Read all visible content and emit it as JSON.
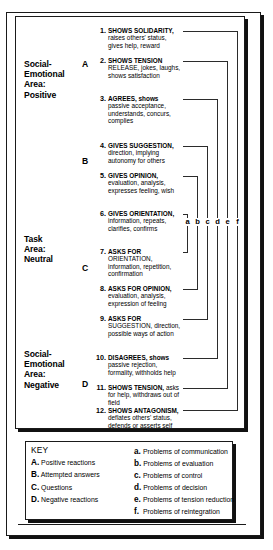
{
  "diagram": {
    "areas": [
      {
        "id": "positive",
        "label": "Social-\nEmotional\nArea:\nPositive",
        "letter": "A"
      },
      {
        "id": "neutral_b",
        "label": "",
        "letter": "B"
      },
      {
        "id": "neutral",
        "label": "Task\nArea:\nNeutral",
        "letter": "C"
      },
      {
        "id": "negative",
        "label": "Social-\nEmotional\nArea:\nNegative",
        "letter": "D"
      }
    ],
    "area_labels": [
      {
        "id": "area-label-positive",
        "lines": [
          "Social-",
          "Emotional",
          "Area:",
          "Positive"
        ]
      },
      {
        "id": "area-label-neutral",
        "lines": [
          "Task",
          "Area:",
          "Neutral"
        ]
      },
      {
        "id": "area-label-negative",
        "lines": [
          "Social-",
          "Emotional",
          "Area:",
          "Negative"
        ]
      }
    ],
    "group_letters": [
      "A",
      "B",
      "C",
      "D"
    ],
    "acts": [
      {
        "num": "1.",
        "head": "SHOWS SOLIDARITY,",
        "body": "raises others' status, gives help, reward"
      },
      {
        "num": "2.",
        "head": "SHOWS TENSION",
        "body": "RELEASE, jokes, laughs, shows satisfaction"
      },
      {
        "num": "3.",
        "head": "AGREES, shows",
        "body": "passive acceptance, understands, concurs, complies"
      },
      {
        "num": "4.",
        "head": "GIVES SUGGESTION,",
        "body": "direction, implying autonomy for others"
      },
      {
        "num": "5.",
        "head": "GIVES OPINION,",
        "body": "evaluation, analysis, expresses feeling, wish"
      },
      {
        "num": "6.",
        "head": "GIVES ORIENTATION,",
        "body": "information, repeats, clarifies, confirms"
      },
      {
        "num": "7.",
        "head": "ASKS FOR",
        "body": "ORIENTATION, information, repetition, confirmation"
      },
      {
        "num": "8.",
        "head": "ASKS FOR OPINION,",
        "body": "evaluation, analysis, expression of feeling"
      },
      {
        "num": "9.",
        "head": "ASKS FOR",
        "body": "SUGGESTION, direction, possible ways of action"
      },
      {
        "num": "10.",
        "head": "DISAGREES, shows",
        "body": "passive rejection, formality, withholds help"
      },
      {
        "num": "11.",
        "head": "SHOWS TENSION,",
        "body": "asks for help, withdraws out of field"
      },
      {
        "num": "12.",
        "head": "SHOWS ANTAGONISM,",
        "body": "deflates others' status, defends or asserts self"
      }
    ],
    "pair_letters": [
      "a",
      "b",
      "c",
      "d",
      "e",
      "f"
    ]
  },
  "key": {
    "title": "KEY",
    "left_items": [
      {
        "letter": "A.",
        "text": "Positive reactions"
      },
      {
        "letter": "B.",
        "text": "Attempted answers"
      },
      {
        "letter": "C.",
        "text": "Questions"
      },
      {
        "letter": "D.",
        "text": "Negative reactions"
      }
    ],
    "right_items": [
      {
        "letter": "a.",
        "text": "Problems of communication"
      },
      {
        "letter": "b.",
        "text": "Problems of evaluation"
      },
      {
        "letter": "c.",
        "text": "Problems of control"
      },
      {
        "letter": "d.",
        "text": "Problems of decision"
      },
      {
        "letter": "e.",
        "text": "Problems of tension reduction"
      },
      {
        "letter": "f.",
        "text": "Problems of reintegration"
      }
    ]
  },
  "colors": {
    "ink": "#000000",
    "rule": "#1a1a1a",
    "shadow": "#111111",
    "paper": "#ffffff"
  }
}
